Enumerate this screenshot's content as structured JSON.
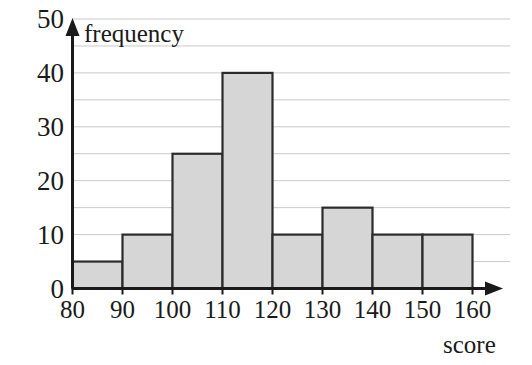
{
  "chart_data": {
    "type": "bar",
    "title": "",
    "subtitle": "",
    "xlabel": "score",
    "ylabel": "frequency",
    "categories": [
      "80-90",
      "90-100",
      "100-110",
      "110-120",
      "120-130",
      "130-140",
      "140-150",
      "150-160"
    ],
    "bin_edges": [
      80,
      90,
      100,
      110,
      120,
      130,
      140,
      150,
      160
    ],
    "values": [
      5,
      10,
      25,
      40,
      10,
      15,
      10,
      10
    ],
    "xlim": [
      80,
      160
    ],
    "ylim": [
      0,
      50
    ],
    "x_tick_labels": [
      "80",
      "90",
      "100",
      "110",
      "120",
      "130",
      "140",
      "150",
      "160"
    ],
    "x_tick_values": [
      80,
      90,
      100,
      110,
      120,
      130,
      140,
      150,
      160
    ],
    "y_tick_labels": [
      "0",
      "10",
      "20",
      "30",
      "40",
      "50"
    ],
    "y_tick_values": [
      0,
      10,
      20,
      30,
      40,
      50
    ],
    "y_gridline_values": [
      5,
      10,
      15,
      20,
      25,
      30,
      35,
      40,
      45
    ],
    "grid": true,
    "grid_color": "#c9c9c9",
    "legend": false,
    "legend_position": "none",
    "bar_fill_color": "#d6d6d6",
    "bar_edge_color": "#2b2b2b",
    "axis_color": "#1a1a1a",
    "background_color": "#ffffff",
    "annotations": []
  },
  "axis_titles": {
    "y": "frequency",
    "x": "score"
  }
}
